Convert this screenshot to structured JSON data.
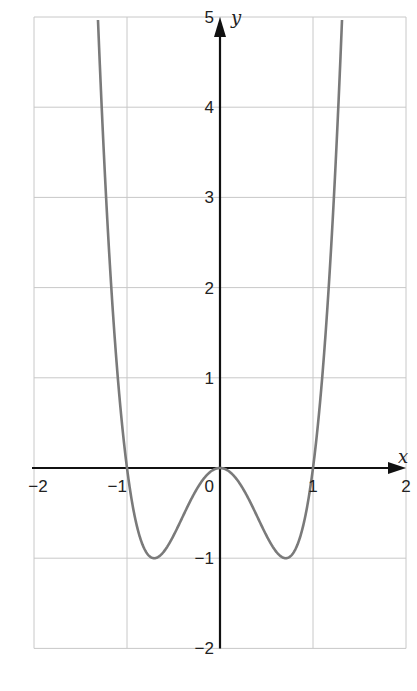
{
  "chart_data": {
    "type": "line",
    "title": "",
    "xlabel": "x",
    "ylabel": "y",
    "xlim": [
      -2,
      2
    ],
    "ylim": [
      -2,
      5
    ],
    "grid": true,
    "legend": null,
    "xticks": [
      -2,
      -1,
      0,
      1,
      2
    ],
    "xtick_labels": [
      "−2",
      "−1",
      "0",
      "1",
      "2"
    ],
    "yticks": [
      -2,
      -1,
      1,
      2,
      3,
      4,
      5
    ],
    "ytick_labels": [
      "−2",
      "−1",
      "1",
      "2",
      "3",
      "4",
      "5"
    ],
    "series": [
      {
        "name": "y = 4x^4 - 4x^2",
        "color": "#7a7a7a",
        "x": [
          -1.31,
          -1.25,
          -1.2,
          -1.1,
          -1.0,
          -0.9,
          -0.8,
          -0.707,
          -0.6,
          -0.5,
          -0.4,
          -0.3,
          -0.2,
          -0.1,
          0,
          0.1,
          0.2,
          0.3,
          0.4,
          0.5,
          0.6,
          0.707,
          0.8,
          0.9,
          1.0,
          1.1,
          1.2,
          1.25,
          1.31
        ],
        "y": [
          4.97,
          3.52,
          2.53,
          1.02,
          0,
          -0.62,
          -0.92,
          -1.0,
          -0.92,
          -0.75,
          -0.54,
          -0.33,
          -0.15,
          -0.04,
          0,
          -0.04,
          -0.15,
          -0.33,
          -0.54,
          -0.75,
          -0.92,
          -1.0,
          -0.92,
          -0.62,
          0,
          1.02,
          2.53,
          3.52,
          4.97
        ]
      }
    ],
    "key_points": {
      "roots": [
        -1,
        0,
        1
      ],
      "local_max": [
        0,
        0
      ],
      "local_min": [
        [
          -0.707,
          -1
        ],
        [
          0.707,
          -1
        ]
      ]
    }
  },
  "colors": {
    "grid": "#c8c8c8",
    "axis": "#111111",
    "curve": "#7a7a7a"
  }
}
